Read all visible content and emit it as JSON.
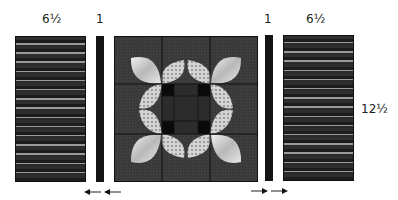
{
  "labels": {
    "left_panel_width": "6½",
    "left_strip_width": "1",
    "right_strip_width": "1",
    "right_panel_width": "6½",
    "panel_height": "12½"
  },
  "arrows": {
    "left_pressing_direction": "left",
    "right_pressing_direction": "right"
  },
  "colors": {
    "block_background": "#3b3b3b",
    "strip_dark": "#141414",
    "petal_light": "#d8d8d8",
    "petal_dotted": "#c8c8c8",
    "cornerstone_black": "#0a0a0a",
    "seam": "#111111"
  },
  "block": {
    "grid": "3x3",
    "large_petals": 4,
    "small_dotted_petals": 8,
    "center_cornerstones": 4
  }
}
